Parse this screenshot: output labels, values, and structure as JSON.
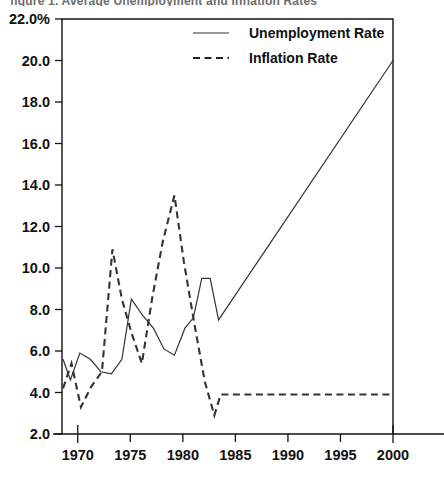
{
  "title_partial": "figure 1.  Average Unemployment and Inflation Rates",
  "axes": {
    "y_ticks": [
      "22.0%",
      "20.0",
      "18.0",
      "16.0",
      "14.0",
      "12.0",
      "10.0",
      "8.0",
      "6.0",
      "4.0",
      "2.0"
    ],
    "x_ticks": [
      "1970",
      "1975",
      "1980",
      "1985",
      "1990",
      "1995",
      "2000"
    ],
    "ylabel": "",
    "xlabel": ""
  },
  "legend": {
    "position": "top-center",
    "items": [
      {
        "label": "Unemployment Rate",
        "style": "solid",
        "key": "unemployment"
      },
      {
        "label": "Inflation Rate",
        "style": "dashed",
        "key": "inflation"
      }
    ]
  },
  "colors": {
    "axis": "#111111",
    "unemployment": "#333333",
    "inflation": "#222222",
    "background": "#ffffff"
  },
  "chart_data": {
    "type": "line",
    "title": "Average Unemployment and Inflation Rates",
    "xlabel": "",
    "ylabel": "Percent",
    "xlim": [
      1968.5,
      2000
    ],
    "ylim": [
      2.0,
      22.0
    ],
    "grid": false,
    "legend_position": "top-center",
    "x_tick_values": [
      1970,
      1975,
      1980,
      1985,
      1990,
      1995,
      2000
    ],
    "y_tick_values": [
      2.0,
      4.0,
      6.0,
      8.0,
      10.0,
      12.0,
      14.0,
      16.0,
      18.0,
      20.0,
      22.0
    ],
    "series": [
      {
        "name": "Unemployment Rate",
        "style": "solid",
        "x": [
          1968.6,
          1969.3,
          1970.2,
          1971.2,
          1972.2,
          1973.2,
          1974.2,
          1975.1,
          1976.2,
          1977.2,
          1978.2,
          1979.2,
          1980.2,
          1981.0,
          1981.8,
          1982.6,
          1983.4,
          2000.0
        ],
        "values": [
          5.6,
          4.6,
          5.9,
          5.6,
          5.0,
          4.9,
          5.6,
          8.5,
          7.7,
          7.1,
          6.1,
          5.8,
          7.1,
          7.6,
          9.5,
          9.5,
          7.5,
          20.0
        ]
      },
      {
        "name": "Inflation Rate",
        "style": "dashed",
        "x": [
          1968.6,
          1969.4,
          1970.3,
          1971.3,
          1972.3,
          1973.3,
          1974.2,
          1975.1,
          1976.1,
          1977.1,
          1978.1,
          1979.2,
          1980.1,
          1981.1,
          1982.1,
          1983.0,
          1983.6,
          2000.0
        ],
        "values": [
          4.2,
          5.4,
          3.3,
          4.3,
          5.0,
          10.9,
          8.5,
          6.9,
          5.4,
          8.6,
          11.3,
          13.5,
          10.3,
          7.3,
          4.5,
          2.9,
          3.9,
          3.9
        ]
      }
    ]
  }
}
